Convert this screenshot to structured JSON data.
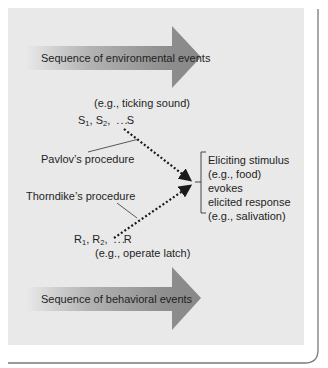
{
  "colors": {
    "panel_bg": "#e9e9e9",
    "arrow_dark": "#8a8a8a",
    "arrow_light": "#e9e9e9",
    "frame_line": "#7a7a7a",
    "dots": "#1a1a1a"
  },
  "arrows": {
    "environmental": {
      "label": "Sequence of environmental events"
    },
    "behavioral": {
      "label": "Sequence of behavioral events"
    }
  },
  "stimulus_sequence": {
    "example": "(e.g., ticking sound)",
    "items": [
      {
        "base": "S",
        "sub": "1",
        "sep": ","
      },
      {
        "base": "S",
        "sub": "2",
        "sep": ","
      }
    ],
    "ellipsis": ". . .",
    "last": "S"
  },
  "response_sequence": {
    "example": "(e.g., operate latch)",
    "items": [
      {
        "base": "R",
        "sub": "1",
        "sep": ","
      },
      {
        "base": "R",
        "sub": "2",
        "sep": ","
      }
    ],
    "ellipsis": ". . .",
    "last": "R"
  },
  "procedures": {
    "pavlov": "Pavlov’s procedure",
    "thorndike": "Thorndike’s procedure"
  },
  "outcome": {
    "lines": [
      "Eliciting stimulus",
      "(e.g., food)",
      "evokes",
      "elicited response",
      "(e.g., salivation)"
    ]
  }
}
